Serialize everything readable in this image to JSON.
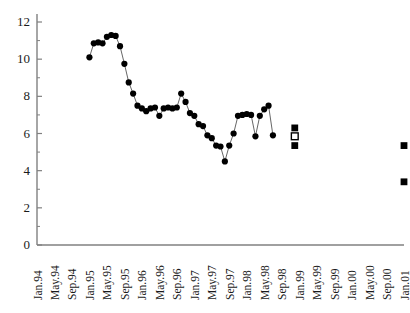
{
  "chart_data": {
    "type": "line",
    "title": "",
    "subtitle": "",
    "xlabel": "",
    "ylabel": "",
    "ylim": [
      0,
      12
    ],
    "yticks": [
      0,
      2,
      4,
      6,
      8,
      10,
      12
    ],
    "ytick_labels": [
      "0",
      "2",
      "4",
      "6",
      "8",
      "10",
      "12"
    ],
    "y_minor_ticks": [
      1,
      3,
      5,
      7,
      9,
      11
    ],
    "grid": false,
    "legend": "none",
    "xtick_labels": [
      "Jan.94",
      "May.94",
      "Sep.94",
      "Jan.95",
      "May.95",
      "Sep.95",
      "Jan.96",
      "May.96",
      "Sep.96",
      "Jan.97",
      "May.97",
      "Sep.97",
      "Jan.98",
      "May.98",
      "Sep.98",
      "Jan.99",
      "May.99",
      "Sep.99",
      "Jan.00",
      "May.00",
      "Sep.00",
      "Jan.01"
    ],
    "x_axis_start": "Jan.94",
    "x_axis_end": "Jan.01",
    "x_tick_interval_months": 4,
    "x_data_interval_months": 1,
    "series": [
      {
        "name": "observed",
        "marker": "filled-circle",
        "line": true,
        "color": "#000000",
        "points": [
          {
            "x": "Jan.95",
            "y": 10.1
          },
          {
            "x": "Feb.95",
            "y": 10.85
          },
          {
            "x": "Mar.95",
            "y": 10.9
          },
          {
            "x": "Apr.95",
            "y": 10.85
          },
          {
            "x": "May.95",
            "y": 11.2
          },
          {
            "x": "Jun.95",
            "y": 11.3
          },
          {
            "x": "Jul.95",
            "y": 11.25
          },
          {
            "x": "Aug.95",
            "y": 10.7
          },
          {
            "x": "Sep.95",
            "y": 9.75
          },
          {
            "x": "Oct.95",
            "y": 8.75
          },
          {
            "x": "Nov.95",
            "y": 8.15
          },
          {
            "x": "Dec.95",
            "y": 7.5
          },
          {
            "x": "Jan.96",
            "y": 7.35
          },
          {
            "x": "Feb.96",
            "y": 7.2
          },
          {
            "x": "Mar.96",
            "y": 7.35
          },
          {
            "x": "Apr.96",
            "y": 7.4
          },
          {
            "x": "May.96",
            "y": 6.95
          },
          {
            "x": "Jun.96",
            "y": 7.35
          },
          {
            "x": "Jul.96",
            "y": 7.4
          },
          {
            "x": "Aug.96",
            "y": 7.35
          },
          {
            "x": "Sep.96",
            "y": 7.4
          },
          {
            "x": "Oct.96",
            "y": 8.15
          },
          {
            "x": "Nov.96",
            "y": 7.7
          },
          {
            "x": "Dec.96",
            "y": 7.1
          },
          {
            "x": "Jan.97",
            "y": 6.95
          },
          {
            "x": "Feb.97",
            "y": 6.5
          },
          {
            "x": "Mar.97",
            "y": 6.4
          },
          {
            "x": "Apr.97",
            "y": 5.9
          },
          {
            "x": "May.97",
            "y": 5.75
          },
          {
            "x": "Jun.97",
            "y": 5.35
          },
          {
            "x": "Jul.97",
            "y": 5.3
          },
          {
            "x": "Aug.97",
            "y": 4.5
          },
          {
            "x": "Sep.97",
            "y": 5.35
          },
          {
            "x": "Oct.97",
            "y": 6.0
          },
          {
            "x": "Nov.97",
            "y": 6.95
          },
          {
            "x": "Dec.97",
            "y": 7.0
          },
          {
            "x": "Jan.98",
            "y": 7.05
          },
          {
            "x": "Feb.98",
            "y": 7.0
          },
          {
            "x": "Mar.98",
            "y": 5.85
          },
          {
            "x": "Apr.98",
            "y": 6.95
          },
          {
            "x": "May.98",
            "y": 7.3
          },
          {
            "x": "Jun.98",
            "y": 7.5
          },
          {
            "x": "Jul.98",
            "y": 5.9
          }
        ]
      },
      {
        "name": "projection-1",
        "marker": "filled-square",
        "line": false,
        "color": "#000000",
        "points": [
          {
            "x": "Dec.98",
            "y": 6.3
          },
          {
            "x": "Dec.98b",
            "y": 5.35
          },
          {
            "x": "Jan.01",
            "y": 5.35
          },
          {
            "x": "Jan.01b",
            "y": 3.4
          }
        ]
      },
      {
        "name": "projection-open",
        "marker": "open-square",
        "line": false,
        "color": "#000000",
        "points": [
          {
            "x": "Dec.98",
            "y": 5.85
          }
        ]
      }
    ]
  },
  "axes": {
    "axis_color": "#808080",
    "marker_color": "#000000",
    "line_color": "#555555"
  }
}
